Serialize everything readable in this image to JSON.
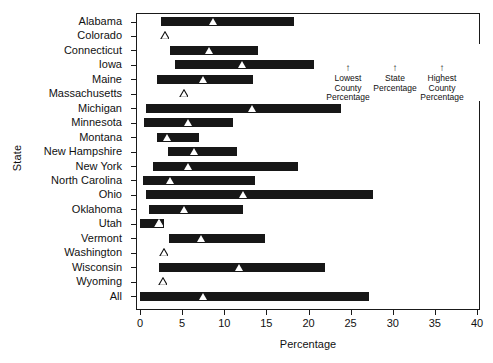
{
  "chart_data": {
    "type": "bar",
    "title": "",
    "subtitle": "",
    "xlabel": "Percentage",
    "ylabel": "State",
    "xlim": [
      0,
      40
    ],
    "ylim": null,
    "grid": false,
    "orientation": "horizontal",
    "xticks": [
      0,
      5,
      10,
      15,
      20,
      25,
      30,
      35,
      40
    ],
    "xticklabels": [
      "0",
      "5",
      "10",
      "15",
      "20",
      "25",
      "30",
      "35",
      "40"
    ],
    "legend_position": "upper-right",
    "legend": {
      "bar_range": [
        25.2,
        36.5
      ],
      "marker_value": 30.3,
      "arrows": [
        "↑",
        "↑",
        "↑"
      ],
      "captions": [
        "Lowest County Percentage",
        "State Percentage",
        "Highest County Percentage"
      ],
      "caption_lines": [
        [
          "Lowest",
          "County",
          "Percentage"
        ],
        [
          "State",
          "Percentage",
          ""
        ],
        [
          "Highest",
          "County",
          "Percentage"
        ]
      ]
    },
    "series_note": "Each row shows the range from lowest to highest county percentage, with a triangle marking the state percentage. Open triangles indicate states with a single value (no county range bar).",
    "categories": [
      "Alabama",
      "Colorado",
      "Connecticut",
      "Iowa",
      "Maine",
      "Massachusetts",
      "Michigan",
      "Minnesota",
      "Montana",
      "New Hampshire",
      "New York",
      "North Carolina",
      "Ohio",
      "Oklahoma",
      "Utah",
      "Vermont",
      "Washington",
      "Wisconsin",
      "Wyoming",
      "All"
    ],
    "rows": [
      {
        "state": "Alabama",
        "low": 2.5,
        "high": 18.3,
        "state_pct": 8.7,
        "has_bar": true,
        "marker": "filled"
      },
      {
        "state": "Colorado",
        "low": null,
        "high": null,
        "state_pct": 3.0,
        "has_bar": false,
        "marker": "open"
      },
      {
        "state": "Connecticut",
        "low": 3.6,
        "high": 14.0,
        "state_pct": 8.2,
        "has_bar": true,
        "marker": "filled"
      },
      {
        "state": "Iowa",
        "low": 4.2,
        "high": 20.6,
        "state_pct": 12.2,
        "has_bar": true,
        "marker": "filled"
      },
      {
        "state": "Maine",
        "low": 2.0,
        "high": 13.4,
        "state_pct": 7.5,
        "has_bar": true,
        "marker": "filled"
      },
      {
        "state": "Massachusetts",
        "low": null,
        "high": null,
        "state_pct": 5.2,
        "has_bar": false,
        "marker": "open"
      },
      {
        "state": "Michigan",
        "low": 0.7,
        "high": 23.8,
        "state_pct": 13.3,
        "has_bar": true,
        "marker": "filled"
      },
      {
        "state": "Minnesota",
        "low": 0.5,
        "high": 11.0,
        "state_pct": 5.8,
        "has_bar": true,
        "marker": "filled"
      },
      {
        "state": "Montana",
        "low": 2.0,
        "high": 7.0,
        "state_pct": 3.3,
        "has_bar": true,
        "marker": "filled"
      },
      {
        "state": "New Hampshire",
        "low": 3.3,
        "high": 11.5,
        "state_pct": 6.5,
        "has_bar": true,
        "marker": "filled"
      },
      {
        "state": "New York",
        "low": 1.5,
        "high": 18.8,
        "state_pct": 5.8,
        "has_bar": true,
        "marker": "filled"
      },
      {
        "state": "North Carolina",
        "low": 0.4,
        "high": 13.7,
        "state_pct": 3.6,
        "has_bar": true,
        "marker": "filled"
      },
      {
        "state": "Ohio",
        "low": 0.7,
        "high": 27.7,
        "state_pct": 12.3,
        "has_bar": true,
        "marker": "filled"
      },
      {
        "state": "Oklahoma",
        "low": 1.1,
        "high": 12.2,
        "state_pct": 5.3,
        "has_bar": true,
        "marker": "filled"
      },
      {
        "state": "Utah",
        "low": 0.0,
        "high": 2.8,
        "state_pct": 2.2,
        "has_bar": true,
        "marker": "open"
      },
      {
        "state": "Vermont",
        "low": 3.4,
        "high": 14.8,
        "state_pct": 7.3,
        "has_bar": true,
        "marker": "filled"
      },
      {
        "state": "Washington",
        "low": null,
        "high": null,
        "state_pct": 2.8,
        "has_bar": false,
        "marker": "open"
      },
      {
        "state": "Wisconsin",
        "low": 2.2,
        "high": 22.0,
        "state_pct": 11.8,
        "has_bar": true,
        "marker": "filled"
      },
      {
        "state": "Wyoming",
        "low": null,
        "high": null,
        "state_pct": 2.7,
        "has_bar": false,
        "marker": "open"
      },
      {
        "state": "All",
        "low": 0.0,
        "high": 27.2,
        "state_pct": 7.5,
        "has_bar": true,
        "marker": "filled"
      }
    ]
  },
  "axes": {
    "x_title": "Percentage",
    "y_title": "State"
  }
}
